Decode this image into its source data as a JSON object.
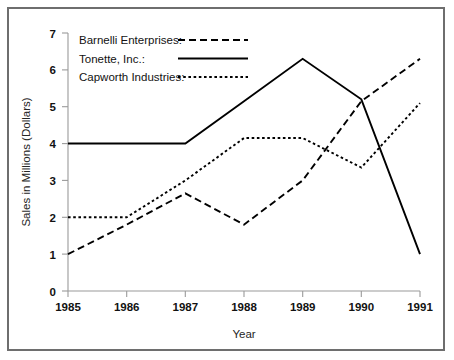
{
  "figure": {
    "frame_color": "#6e6e6e",
    "background_color": "#ffffff",
    "ink_color": "#000000",
    "axis_color": "#9a9a9a"
  },
  "axes": {
    "x_title": "Year",
    "y_title": "Sales in Millions (Dollars)",
    "x_tick_labels": [
      "1985",
      "1986",
      "1987",
      "1988",
      "1989",
      "1990",
      "1991"
    ],
    "y_tick_labels": [
      "0",
      "1",
      "2",
      "3",
      "4",
      "5",
      "6",
      "7"
    ]
  },
  "legend": {
    "position": "upper-left-inside-plot",
    "entries": [
      {
        "label": "Barnelli Enterprises:",
        "dash": "long-dash",
        "sample_name": "legend-line-barnelli"
      },
      {
        "label": "Tonette, Inc.:",
        "dash": "solid",
        "sample_name": "legend-line-tonette"
      },
      {
        "label": "Capworth Industries:",
        "dash": "dotted",
        "sample_name": "legend-line-capworth"
      }
    ]
  },
  "chart_data": {
    "type": "line",
    "title": "",
    "subtitle": "",
    "xlabel": "Year",
    "ylabel": "Sales in Millions (Dollars)",
    "x": [
      1985,
      1986,
      1987,
      1988,
      1989,
      1990,
      1991
    ],
    "categories": [
      "1985",
      "1986",
      "1987",
      "1988",
      "1989",
      "1990",
      "1991"
    ],
    "xlim": [
      1985,
      1991
    ],
    "ylim": [
      0,
      7
    ],
    "yticks": [
      0,
      1,
      2,
      3,
      4,
      5,
      6,
      7
    ],
    "grid": false,
    "legend_position": "upper left",
    "series": [
      {
        "name": "Barnelli Enterprises",
        "style": "long-dash",
        "color": "#000000",
        "values": [
          1.0,
          1.8,
          2.65,
          1.8,
          3.0,
          5.15,
          6.3
        ]
      },
      {
        "name": "Tonette, Inc.",
        "style": "solid",
        "color": "#000000",
        "values": [
          4.0,
          4.0,
          4.0,
          5.15,
          6.3,
          5.2,
          1.0
        ]
      },
      {
        "name": "Capworth Industries",
        "style": "dotted",
        "color": "#000000",
        "values": [
          2.0,
          2.0,
          3.0,
          4.15,
          4.15,
          3.35,
          5.1
        ]
      }
    ]
  }
}
